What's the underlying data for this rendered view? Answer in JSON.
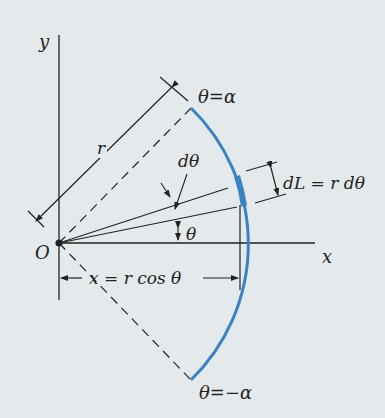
{
  "figure": {
    "background": "#e4e9ec",
    "arc_color": "#3a82c4",
    "line_color": "#222222",
    "labels": {
      "y_axis": "y",
      "x_axis": "x",
      "origin": "O",
      "radius": "r",
      "theta_upper": "θ=α",
      "theta_lower": "θ=−α",
      "d_theta": "dθ",
      "theta": "θ",
      "dL": "dL = r dθ",
      "x_eq": "x = r cos θ"
    }
  }
}
